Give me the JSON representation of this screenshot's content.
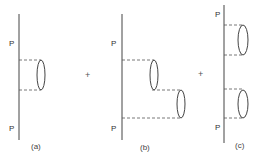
{
  "figure": {
    "colors": {
      "line": "#444444",
      "dash": "#555555",
      "text": "#333333"
    },
    "operators": [
      {
        "symbol": "+",
        "x": 88,
        "y": 77
      },
      {
        "symbol": "+",
        "x": 201,
        "y": 77
      }
    ],
    "panels": [
      {
        "caption": "(a)",
        "caption_pos": [
          36,
          149
        ],
        "line": {
          "x": 19,
          "y1": 14,
          "y2": 140
        },
        "labels": [
          {
            "text": "P",
            "x": 9,
            "y": 46
          },
          {
            "text": "P",
            "x": 9,
            "y": 131
          }
        ]
      },
      {
        "caption": "(b)",
        "caption_pos": [
          144,
          150
        ],
        "line": {
          "x": 122,
          "y1": 14,
          "y2": 140
        },
        "labels": [
          {
            "text": "P",
            "x": 111,
            "y": 46
          },
          {
            "text": "P",
            "x": 111,
            "y": 131
          }
        ]
      },
      {
        "caption": "(c)",
        "caption_pos": [
          237,
          148
        ],
        "line": {
          "x": 224,
          "y1": 5,
          "y2": 143
        },
        "labels": [
          {
            "text": "P",
            "x": 215,
            "y": 17
          },
          {
            "text": "P",
            "x": 215,
            "y": 130
          }
        ]
      }
    ]
  }
}
